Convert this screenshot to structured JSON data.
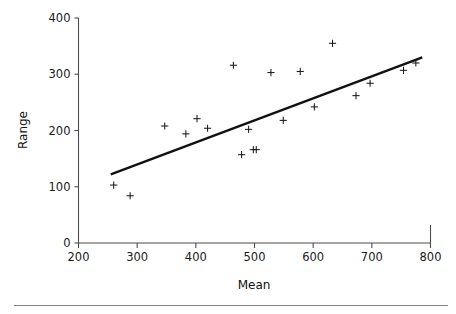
{
  "chart_data": {
    "type": "scatter",
    "title": "",
    "xlabel": "Mean",
    "ylabel": "Range",
    "xlim": [
      200,
      800
    ],
    "ylim": [
      0,
      400
    ],
    "xticks": [
      200,
      300,
      400,
      500,
      600,
      700,
      800
    ],
    "yticks": [
      0,
      100,
      200,
      300,
      400
    ],
    "xtick_labels": [
      "200",
      "300",
      "400",
      "500",
      "600",
      "700",
      "800"
    ],
    "ytick_labels": [
      "0",
      "100",
      "200",
      "300",
      "400"
    ],
    "grid": false,
    "legend": null,
    "marker": "plus",
    "marker_color": "#1a1a1a",
    "points": [
      {
        "x": 260,
        "y": 103
      },
      {
        "x": 288,
        "y": 84
      },
      {
        "x": 347,
        "y": 208
      },
      {
        "x": 383,
        "y": 194
      },
      {
        "x": 402,
        "y": 221
      },
      {
        "x": 420,
        "y": 204
      },
      {
        "x": 464,
        "y": 316
      },
      {
        "x": 478,
        "y": 157
      },
      {
        "x": 490,
        "y": 202
      },
      {
        "x": 498,
        "y": 166
      },
      {
        "x": 503,
        "y": 166
      },
      {
        "x": 528,
        "y": 303
      },
      {
        "x": 549,
        "y": 218
      },
      {
        "x": 578,
        "y": 305
      },
      {
        "x": 602,
        "y": 242
      },
      {
        "x": 633,
        "y": 355
      },
      {
        "x": 673,
        "y": 262
      },
      {
        "x": 697,
        "y": 284
      },
      {
        "x": 754,
        "y": 307
      },
      {
        "x": 775,
        "y": 320
      }
    ],
    "fit_line": {
      "x_start": 255,
      "y_start": 122,
      "x_end": 786,
      "y_end": 330,
      "color": "#111111"
    }
  },
  "figure": {
    "axis_color": "#4d4d4d",
    "background": "#ffffff",
    "footer_rule_color": "#808080"
  }
}
